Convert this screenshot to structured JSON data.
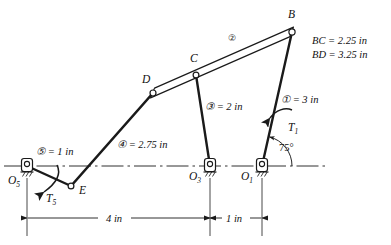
{
  "figure": {
    "type": "mechanism-linkage-diagram",
    "ink_color": "#1a1a1a",
    "background": "#ffffff"
  },
  "joints": [
    {
      "id": "B",
      "label": "B",
      "x": 292,
      "y": 32,
      "label_x": 288,
      "label_y": 18,
      "fixed": false
    },
    {
      "id": "C",
      "label": "C",
      "x": 196,
      "y": 75,
      "label_x": 190,
      "label_y": 62,
      "fixed": false
    },
    {
      "id": "D",
      "label": "D",
      "x": 153,
      "y": 93,
      "label_x": 142,
      "label_y": 83,
      "fixed": false
    },
    {
      "id": "E",
      "label": "E",
      "x": 71,
      "y": 186,
      "label_x": 79,
      "label_y": 194,
      "fixed": false
    },
    {
      "id": "O1",
      "label": "O",
      "sub": "1",
      "x": 262,
      "y": 166,
      "label_x": 241,
      "label_y": 180,
      "fixed": true
    },
    {
      "id": "O3",
      "label": "O",
      "sub": "3",
      "x": 210,
      "y": 166,
      "label_x": 189,
      "label_y": 180,
      "fixed": true
    },
    {
      "id": "O5",
      "label": "O",
      "sub": "5",
      "x": 27,
      "y": 166,
      "label_x": 8,
      "label_y": 184,
      "fixed": true
    }
  ],
  "links": [
    {
      "number": "1",
      "circled": "①",
      "length_label": "① = 3 in",
      "from": "O1",
      "to": "B",
      "style": "single",
      "label_x": 281,
      "label_y": 103
    },
    {
      "number": "2",
      "circled": "②",
      "length_label": "②",
      "from": "D",
      "to": "B",
      "style": "bar",
      "label_x": 228,
      "label_y": 41
    },
    {
      "number": "3",
      "circled": "③",
      "length_label": "③ = 2 in",
      "from": "O3",
      "to": "C",
      "style": "single",
      "label_x": 205,
      "label_y": 110
    },
    {
      "number": "4",
      "circled": "④",
      "length_label": "④ = 2.75 in",
      "from": "E",
      "to": "D",
      "style": "single",
      "label_x": 117,
      "label_y": 148
    },
    {
      "number": "5",
      "circled": "⑤",
      "length_label": "⑤ = 1 in",
      "from": "O5",
      "to": "E",
      "style": "single",
      "label_x": 36,
      "label_y": 155
    }
  ],
  "annotations": {
    "coupler_dims": [
      "BC = 2.25 in",
      "BD = 3.25 in"
    ],
    "angle": {
      "value": "75°",
      "x": 279,
      "y": 151,
      "vertex": "O1"
    },
    "torques": [
      {
        "id": "T1",
        "base": "T",
        "sub": "1",
        "x": 288,
        "y": 131,
        "sense": "counterclockwise",
        "applied_to": "link-1"
      },
      {
        "id": "T5",
        "base": "T",
        "sub": "5",
        "x": 46,
        "y": 202,
        "sense": "clockwise",
        "applied_to": "link-5"
      }
    ]
  },
  "dimensions": [
    {
      "id": "dim-4in",
      "label": "4 in",
      "from_x": 27,
      "to_x": 210,
      "y": 218,
      "label_x": 106,
      "label_y": 215
    },
    {
      "id": "dim-1in",
      "label": "1 in",
      "from_x": 210,
      "to_x": 262,
      "y": 218,
      "label_x": 224,
      "label_y": 215
    }
  ],
  "baseline": {
    "y": 166,
    "from_x": 4,
    "to_x": 325,
    "style": "dash-dot"
  }
}
